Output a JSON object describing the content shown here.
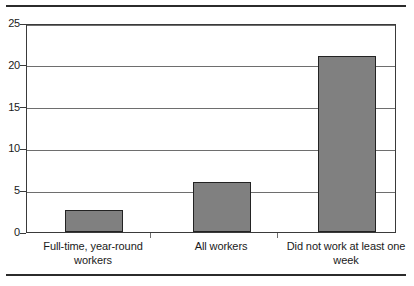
{
  "chart_data": {
    "type": "bar",
    "title": "",
    "subtitle": "",
    "xlabel": "",
    "ylabel": "",
    "categories": [
      "Full-time, year-round workers",
      "All workers",
      "Did not work at least one week"
    ],
    "values": [
      2.6,
      6.0,
      21.0
    ],
    "ylim": [
      0,
      25
    ],
    "yticks": [
      0,
      5,
      10,
      15,
      20,
      25
    ],
    "ytick_labels": [
      "0",
      "5",
      "10",
      "15",
      "20",
      "25"
    ],
    "grid": true,
    "legend": false,
    "legend_position": "none",
    "series": [
      {
        "name": "",
        "values": [
          2.6,
          6.0,
          21.0
        ]
      }
    ],
    "colors": {
      "bar_fill": "#808080",
      "bar_border": "#232323",
      "gridline": "#6e6e6e",
      "axis": "#3a3a3a",
      "text": "#1a1a1a",
      "background": "#ffffff",
      "rule": "#2b2b2b"
    }
  },
  "category_label_lines": [
    [
      "Full-time, year-round",
      "workers"
    ],
    [
      "All workers",
      ""
    ],
    [
      "Did not work at least one",
      "week"
    ]
  ]
}
